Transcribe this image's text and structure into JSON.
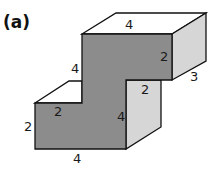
{
  "figure": {
    "label": "(a)",
    "colors": {
      "front_face": "#8c8c8c",
      "top_face": "#ffffff",
      "side_face": "#d6d6d6",
      "edge": "#111111"
    },
    "dimensions": {
      "top_width": "4",
      "top_right_height": "2",
      "depth": "3",
      "upper_left_height": "4",
      "step_right": "2",
      "step_left": "2",
      "middle_height": "4",
      "lower_left_height": "2",
      "bottom_width": "4"
    }
  }
}
